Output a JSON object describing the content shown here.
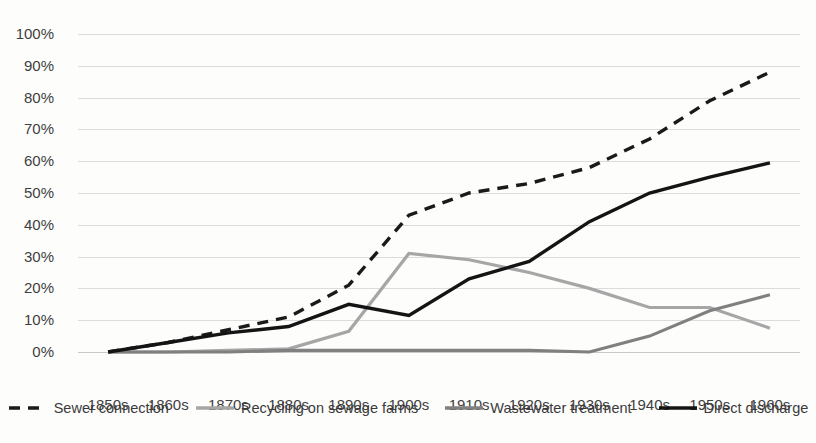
{
  "chart_data": {
    "type": "line",
    "title": "",
    "xlabel": "",
    "ylabel": "",
    "ylim": [
      0,
      100
    ],
    "grid": true,
    "legend_position": "bottom",
    "categories": [
      "1850s",
      "1860s",
      "1870s",
      "1880s",
      "1890s",
      "1900s",
      "1910s",
      "1920s",
      "1930s",
      "1940s",
      "1950s",
      "1960s"
    ],
    "ytick_labels": [
      "0%",
      "10%",
      "20%",
      "30%",
      "40%",
      "50%",
      "60%",
      "70%",
      "80%",
      "90%",
      "100%"
    ],
    "ytick_values": [
      0,
      10,
      20,
      30,
      40,
      50,
      60,
      70,
      80,
      90,
      100
    ],
    "series": [
      {
        "name": "Sewer connection",
        "style": "dashed",
        "color": "#1a1a1a",
        "width": 3.4,
        "values": [
          0,
          3,
          7,
          11,
          21,
          43,
          50,
          53,
          58,
          67,
          79,
          88
        ]
      },
      {
        "name": "Recycling on sewage farms",
        "style": "solid",
        "color": "#a6a6a6",
        "width": 3.2,
        "values": [
          0,
          0,
          0.5,
          1,
          6.5,
          31,
          29,
          25,
          20,
          14,
          14,
          7.5
        ]
      },
      {
        "name": "Wastewater treatment",
        "style": "solid",
        "color": "#808080",
        "width": 3.2,
        "values": [
          0,
          0,
          0,
          0.5,
          0.5,
          0.5,
          0.5,
          0.5,
          0,
          5,
          13,
          18
        ]
      },
      {
        "name": "Direct discharge",
        "style": "solid",
        "color": "#141414",
        "width": 3.4,
        "values": [
          0,
          3,
          6,
          8,
          15,
          11.5,
          23,
          28.5,
          41,
          50,
          55,
          59.5
        ]
      }
    ]
  },
  "legend": {
    "items": [
      {
        "label": "Sewer connection",
        "style": "dashed",
        "color": "#1a1a1a"
      },
      {
        "label": "Recycling on sewage farms",
        "style": "solid",
        "color": "#a6a6a6"
      },
      {
        "label": "Wastewater treatment",
        "style": "solid",
        "color": "#808080"
      },
      {
        "label": "Direct discharge",
        "style": "solid",
        "color": "#141414"
      }
    ]
  }
}
